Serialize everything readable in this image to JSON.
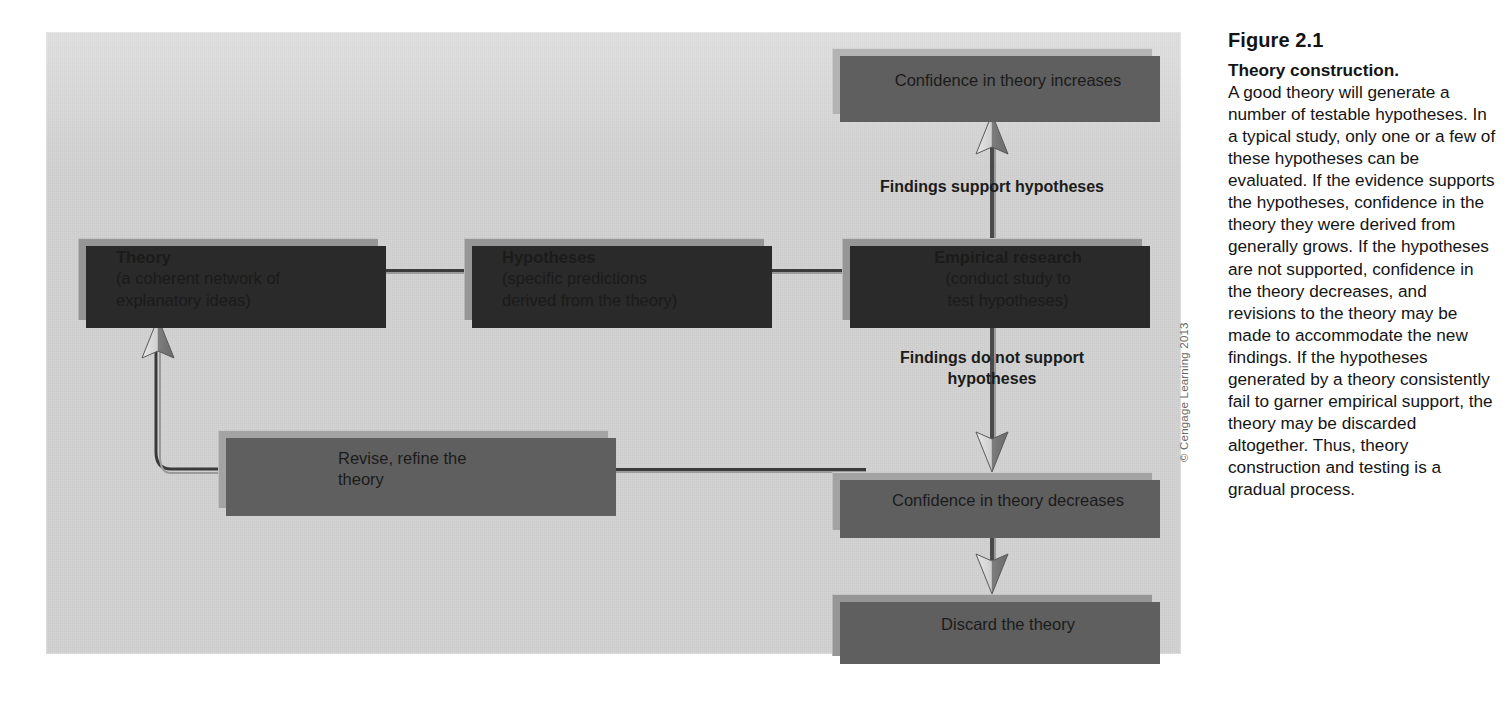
{
  "figure": {
    "number": "Figure 2.1",
    "title": "Theory construction.",
    "body": "A good theory will generate a number of testable hypotheses. In a typical study, only one or a few of these hypotheses can be evaluated. If the evidence supports the hypotheses, confidence in the theory they were derived from generally grows. If the hypotheses are not supported, confidence in the theory decreases, and revisions to the theory may be made to accommodate the new findings. If the hypotheses generated by a theory consistently fail to garner empirical support, the theory may be discarded altogether. Thus, theory construction and testing is a gradual process.",
    "credit": "© Cengage Learning 2013"
  },
  "diagram": {
    "nodes": {
      "theory": {
        "title": "Theory",
        "line1": "(a coherent network of",
        "line2": "explanatory ideas)"
      },
      "hypotheses": {
        "title": "Hypotheses",
        "line1": "(specific predictions",
        "line2": "derived from the theory)"
      },
      "empirical_research": {
        "title": "Empirical research",
        "line1": "(conduct study to",
        "line2": "test hypotheses)"
      },
      "confidence_increases": {
        "label": "Confidence in theory increases"
      },
      "confidence_decreases": {
        "label": "Confidence in theory decreases"
      },
      "discard": {
        "label": "Discard the theory"
      },
      "revise": {
        "line1": "Revise, refine the",
        "line2": "theory"
      }
    },
    "edges": {
      "support": {
        "label": "Findings support hypotheses"
      },
      "no_support": {
        "line1": "Findings do not support",
        "line2": "hypotheses"
      }
    },
    "colors": {
      "panel_background": "#d2d2d2",
      "box_dark": "#969696",
      "box_mid": "#a3a3a3",
      "box_light": "#b3b3b3",
      "shadow_dark": "#2a2a2a",
      "shadow_soft": "#5f5f5f",
      "arrow_stroke": "#4a4a4a",
      "text": "#1b1b1b"
    }
  }
}
